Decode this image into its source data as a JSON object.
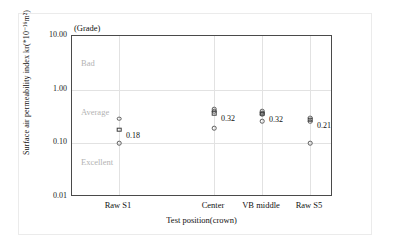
{
  "chart_data": {
    "type": "scatter",
    "title": "",
    "xlabel": "Test position(crown)",
    "ylabel": "Surface air permeability index kr(*10-16m2)",
    "ylabel_display": "Surface air permeability index kr(*10⁻¹⁶m²)",
    "grade_caption": "(Grade)",
    "yscale": "log",
    "ylim": [
      0.01,
      10.0
    ],
    "ytick_labels": [
      "10.00",
      "1.00",
      "0.10",
      "0.01"
    ],
    "ytick_values": [
      10.0,
      1.0,
      0.1,
      0.01
    ],
    "grid": true,
    "legend": "none",
    "categories": [
      "Raw S1",
      "Center",
      "VB middle",
      "Raw S5"
    ],
    "grade_bands": [
      {
        "label": "Bad",
        "value": 3.2
      },
      {
        "label": "Average",
        "value": 0.38
      },
      {
        "label": "Excellent",
        "value": 0.045
      }
    ],
    "series": [
      {
        "name": "individual measurements",
        "marker": "open-circle",
        "points": [
          {
            "category": "Raw S1",
            "value": 0.29
          },
          {
            "category": "Raw S1",
            "value": 0.1
          },
          {
            "category": "Center",
            "value": 0.43
          },
          {
            "category": "Center",
            "value": 0.4
          },
          {
            "category": "Center",
            "value": 0.19
          },
          {
            "category": "VB middle",
            "value": 0.4
          },
          {
            "category": "VB middle",
            "value": 0.37
          },
          {
            "category": "VB middle",
            "value": 0.345
          },
          {
            "category": "VB middle",
            "value": 0.26
          },
          {
            "category": "Raw S5",
            "value": 0.3
          },
          {
            "category": "Raw S5",
            "value": 0.255
          },
          {
            "category": "Raw S5",
            "value": 0.1
          }
        ]
      },
      {
        "name": "mean value",
        "marker": "open-square",
        "points": [
          {
            "category": "Raw S1",
            "value": 0.18,
            "label": "0.18"
          },
          {
            "category": "Center",
            "value": 0.36,
            "label": "0.32"
          },
          {
            "category": "VB middle",
            "value": 0.355,
            "label": "0.32"
          },
          {
            "category": "Raw S5",
            "value": 0.275,
            "label": "0.21"
          }
        ]
      }
    ],
    "value_labels": [
      "0.18",
      "0.32",
      "0.32",
      "0.21"
    ]
  }
}
